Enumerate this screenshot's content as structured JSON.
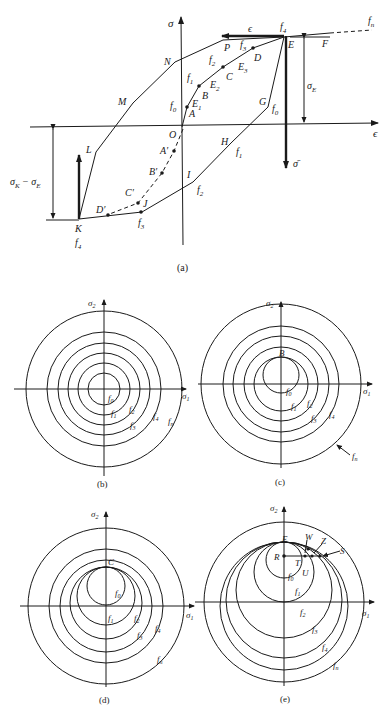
{
  "panel_a": {
    "caption": "(a)",
    "axis_sigma": "σ",
    "axis_eps_right": "ϵ",
    "axis_eps_arrow": "ϵ",
    "sigma_bar": "σ̄",
    "label_sigmaE": "σ",
    "label_sigmaE_sub": "E",
    "label_diff": "σ",
    "label_diff_subK": "K",
    "label_diff_mid": " − σ",
    "label_diff_subE": "E",
    "points": {
      "O": "O",
      "A": "A",
      "B": "B",
      "C": "C",
      "D": "D",
      "E": "E",
      "F": "F",
      "G": "G",
      "H": "H",
      "I": "I",
      "J": "J",
      "K": "K",
      "L": "L",
      "M": "M",
      "N": "N",
      "P": "P",
      "A1": "A′",
      "B1": "B′",
      "C1": "C′",
      "D1": "D′",
      "E1": "E",
      "E2": "E",
      "E3": "E"
    },
    "surfaces": {
      "f0": "f",
      "f1": "f",
      "f2": "f",
      "f3": "f",
      "f4": "f",
      "fn": "f"
    },
    "subs": {
      "0": "0",
      "1": "1",
      "2": "2",
      "3": "3",
      "4": "4",
      "n": "n"
    }
  },
  "panel_b": {
    "caption": "(b)",
    "sigma1": "σ",
    "sigma2": "σ"
  },
  "panel_c": {
    "caption": "(c)",
    "sigma1": "σ",
    "sigma2": "σ",
    "point": "B"
  },
  "panel_d": {
    "caption": "(d)",
    "sigma1": "σ",
    "sigma2": "σ",
    "point": "C"
  },
  "panel_e": {
    "caption": "(e)",
    "sigma1": "σ",
    "sigma2": "σ",
    "points": {
      "E": "E",
      "R": "R",
      "T": "T",
      "U": "U",
      "W": "W",
      "Z": "Z",
      "S": "S"
    }
  }
}
